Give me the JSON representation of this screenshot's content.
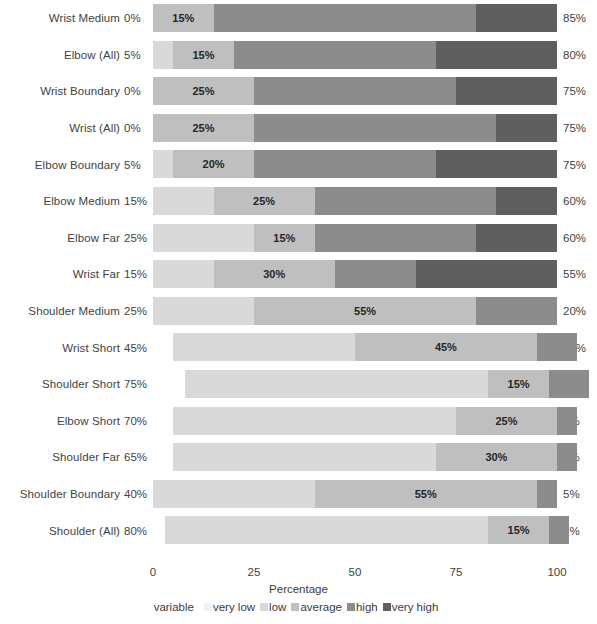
{
  "chart_data": {
    "type": "bar",
    "subtype": "diverging-stacked-likert",
    "title": "",
    "xlabel": "Percentage",
    "ylabel": "",
    "xlim": [
      0,
      100
    ],
    "xticks": [
      0,
      25,
      50,
      75,
      100
    ],
    "xtick_labels": [
      "0",
      "25",
      "50",
      "75",
      "100"
    ],
    "grid": false,
    "legend_position": "bottom",
    "legend_title": "variable",
    "series": [
      {
        "name": "very low",
        "color": "#f2f2f2"
      },
      {
        "name": "low",
        "color": "#d9d9d9"
      },
      {
        "name": "average",
        "color": "#bfbfbf"
      },
      {
        "name": "high",
        "color": "#8c8c8c"
      },
      {
        "name": "very high",
        "color": "#5f5f5f"
      }
    ],
    "categories": [
      "Wrist Medium",
      "Elbow (All)",
      "Wrist Boundary",
      "Wrist (All)",
      "Elbow Boundary",
      "Elbow Medium",
      "Elbow Far",
      "Wrist Far",
      "Shoulder Medium",
      "Wrist Short",
      "Shoulder Short",
      "Elbow Short",
      "Shoulder Far",
      "Shoulder Boundary",
      "Shoulder (All)"
    ],
    "left_labels": [
      "0%",
      "5%",
      "0%",
      "0%",
      "5%",
      "15%",
      "25%",
      "15%",
      "25%",
      "45%",
      "75%",
      "70%",
      "65%",
      "40%",
      "80%"
    ],
    "right_labels": [
      "85%",
      "80%",
      "75%",
      "75%",
      "75%",
      "60%",
      "60%",
      "55%",
      "20%",
      "10%",
      "10%",
      "5%",
      "5%",
      "5%",
      "5%"
    ],
    "rows": [
      {
        "category": "Wrist Medium",
        "very_low": 0,
        "low": 0,
        "average": 15,
        "high": 65,
        "very_high": 20,
        "start": 0,
        "center_label": "15%"
      },
      {
        "category": "Elbow (All)",
        "very_low": 0,
        "low": 5,
        "average": 15,
        "high": 50,
        "very_high": 30,
        "start": 0,
        "center_label": "15%"
      },
      {
        "category": "Wrist Boundary",
        "very_low": 0,
        "low": 0,
        "average": 25,
        "high": 50,
        "very_high": 25,
        "start": 0,
        "center_label": "25%"
      },
      {
        "category": "Wrist (All)",
        "very_low": 0,
        "low": 0,
        "average": 25,
        "high": 60,
        "very_high": 15,
        "start": 0,
        "center_label": "25%"
      },
      {
        "category": "Elbow Boundary",
        "very_low": 0,
        "low": 5,
        "average": 20,
        "high": 45,
        "very_high": 30,
        "start": 0,
        "center_label": "20%"
      },
      {
        "category": "Elbow Medium",
        "very_low": 0,
        "low": 15,
        "average": 25,
        "high": 45,
        "very_high": 15,
        "start": 0,
        "center_label": "25%"
      },
      {
        "category": "Elbow Far",
        "very_low": 0,
        "low": 25,
        "average": 15,
        "high": 40,
        "very_high": 20,
        "start": 0,
        "center_label": "15%"
      },
      {
        "category": "Wrist Far",
        "very_low": 0,
        "low": 15,
        "average": 30,
        "high": 20,
        "very_high": 35,
        "start": 0,
        "center_label": "30%"
      },
      {
        "category": "Shoulder Medium",
        "very_low": 0,
        "low": 25,
        "average": 55,
        "high": 20,
        "very_high": 0,
        "start": 0,
        "center_label": "55%"
      },
      {
        "category": "Wrist Short",
        "very_low": 0,
        "low": 45,
        "average": 45,
        "high": 10,
        "very_high": 0,
        "start": 5,
        "center_label": "45%"
      },
      {
        "category": "Shoulder Short",
        "very_low": 0,
        "low": 75,
        "average": 15,
        "high": 10,
        "very_high": 0,
        "start": 8,
        "center_label": "15%"
      },
      {
        "category": "Elbow Short",
        "very_low": 0,
        "low": 70,
        "average": 25,
        "high": 5,
        "very_high": 0,
        "start": 5,
        "center_label": "25%"
      },
      {
        "category": "Shoulder Far",
        "very_low": 0,
        "low": 65,
        "average": 30,
        "high": 5,
        "very_high": 0,
        "start": 5,
        "center_label": "30%"
      },
      {
        "category": "Shoulder Boundary",
        "very_low": 0,
        "low": 40,
        "average": 55,
        "high": 5,
        "very_high": 0,
        "start": 0,
        "center_label": "55%"
      },
      {
        "category": "Shoulder (All)",
        "very_low": 0,
        "low": 80,
        "average": 15,
        "high": 5,
        "very_high": 0,
        "start": 3,
        "center_label": "15%"
      }
    ]
  }
}
